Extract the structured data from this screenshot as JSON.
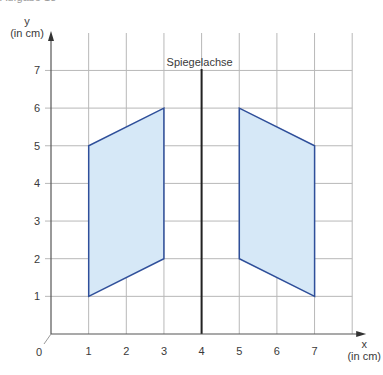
{
  "caption": "Aufgabe 18",
  "chart_data": {
    "type": "diagram",
    "title": "",
    "xlabel": "x",
    "xunit": "(in cm)",
    "ylabel": "y",
    "yunit": "(in cm)",
    "origin_label": "0",
    "x_ticks": [
      "1",
      "2",
      "3",
      "4",
      "5",
      "6",
      "7"
    ],
    "y_ticks": [
      "1",
      "2",
      "3",
      "4",
      "5",
      "6",
      "7"
    ],
    "xlim": [
      0,
      8
    ],
    "ylim": [
      0,
      8
    ],
    "grid": true,
    "mirror_axis": {
      "label": "Spiegelachse",
      "x": 4
    },
    "shapes": [
      {
        "name": "original",
        "points": [
          [
            1,
            1
          ],
          [
            3,
            2
          ],
          [
            3,
            6
          ],
          [
            1,
            5
          ]
        ]
      },
      {
        "name": "mirror-image",
        "points": [
          [
            7,
            1
          ],
          [
            5,
            2
          ],
          [
            5,
            6
          ],
          [
            7,
            5
          ]
        ]
      }
    ],
    "colors": {
      "fill": "#d6e8f7",
      "stroke": "#2f4f9a",
      "grid": "#b8b8b8",
      "axis": "#555555"
    }
  }
}
